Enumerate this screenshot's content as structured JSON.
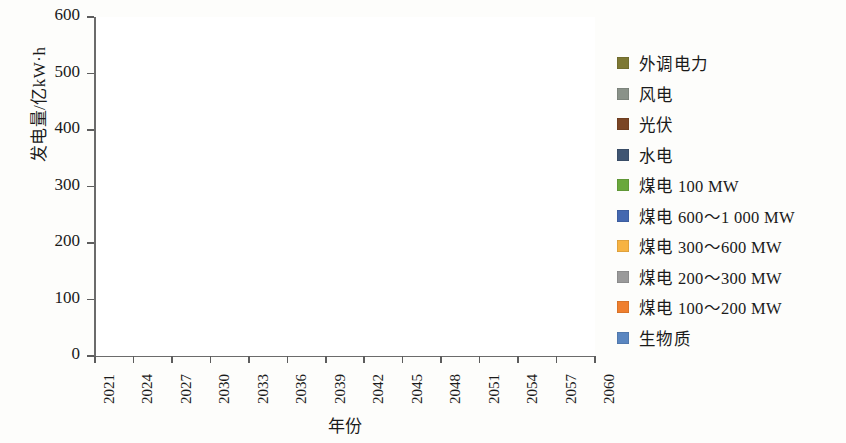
{
  "axes": {
    "y_title": "发电量/亿kW·h",
    "x_title": "年份",
    "y_ticks": [
      "0",
      "100",
      "200",
      "300",
      "400",
      "500",
      "600"
    ],
    "x_ticks": [
      "2021",
      "2024",
      "2027",
      "2030",
      "2033",
      "2036",
      "2039",
      "2042",
      "2045",
      "2048",
      "2051",
      "2054",
      "2057",
      "2060"
    ]
  },
  "legend": {
    "items": [
      {
        "label": "外调电力",
        "color": "#7d7833"
      },
      {
        "label": "风电",
        "color": "#8a9289"
      },
      {
        "label": "光伏",
        "color": "#7a4524"
      },
      {
        "label": "水电",
        "color": "#3f5572"
      },
      {
        "label": "煤电  100 MW",
        "color": "#6aa83c"
      },
      {
        "label": "煤电  600～1 000 MW",
        "color": "#4468b0"
      },
      {
        "label": "煤电  300～600 MW",
        "color": "#f7b342"
      },
      {
        "label": "煤电  200～300 MW",
        "color": "#9a9a9a"
      },
      {
        "label": "煤电  100～200 MW",
        "color": "#ef7f2e"
      },
      {
        "label": "生物质",
        "color": "#5a86c0"
      }
    ]
  },
  "chart_data": {
    "type": "area",
    "stacked": true,
    "title": "",
    "xlabel": "年份",
    "ylabel": "发电量/亿kW·h",
    "ylim": [
      0,
      600
    ],
    "grid": false,
    "legend_position": "right",
    "x": [
      2021,
      2022,
      2023,
      2024,
      2025,
      2026,
      2027,
      2028,
      2029,
      2030,
      2031,
      2032,
      2033,
      2034,
      2035,
      2036,
      2037,
      2038,
      2039,
      2040,
      2041,
      2042,
      2043,
      2044,
      2045,
      2046,
      2047,
      2048,
      2049,
      2050,
      2051,
      2052,
      2053,
      2054,
      2055,
      2056,
      2057,
      2058,
      2059,
      2060
    ],
    "series": [
      {
        "name": "生物质",
        "color": "#5a86c0",
        "values": [
          0,
          0,
          0,
          0,
          0,
          0,
          0,
          0,
          0,
          0,
          0,
          0,
          0,
          0,
          0,
          0,
          0,
          0,
          0,
          0,
          0,
          0,
          0,
          0,
          0,
          0,
          0,
          0,
          0,
          0,
          0,
          0,
          0,
          0,
          0,
          0,
          0,
          0,
          0,
          0
        ]
      },
      {
        "name": "煤电  100～200 MW",
        "color": "#ef7f2e",
        "values": [
          10,
          9,
          8,
          7,
          6,
          4,
          2,
          0,
          0,
          0,
          0,
          0,
          0,
          0,
          0,
          0,
          0,
          0,
          0,
          0,
          0,
          0,
          0,
          0,
          0,
          0,
          0,
          0,
          0,
          0,
          0,
          0,
          0,
          0,
          0,
          0,
          0,
          0,
          0,
          0
        ]
      },
      {
        "name": "煤电  200～300 MW",
        "color": "#9a9a9a",
        "values": [
          80,
          78,
          76,
          74,
          72,
          70,
          68,
          66,
          64,
          62,
          58,
          54,
          48,
          44,
          38,
          32,
          26,
          20,
          14,
          8,
          4,
          0,
          0,
          0,
          0,
          0,
          0,
          0,
          0,
          0,
          0,
          0,
          0,
          0,
          0,
          0,
          0,
          0,
          0,
          0
        ]
      },
      {
        "name": "煤电  300～600 MW",
        "color": "#f7b342",
        "values": [
          82,
          86,
          88,
          86,
          84,
          82,
          80,
          82,
          84,
          86,
          84,
          82,
          80,
          78,
          76,
          74,
          74,
          72,
          70,
          66,
          62,
          56,
          46,
          28,
          0,
          0,
          0,
          0,
          0,
          0,
          0,
          0,
          0,
          0,
          0,
          0,
          0,
          0,
          0,
          0
        ]
      },
      {
        "name": "煤电  600～1 000 MW",
        "color": "#4468b0",
        "values": [
          0,
          0,
          0,
          0,
          2,
          10,
          20,
          28,
          40,
          46,
          52,
          58,
          62,
          66,
          70,
          74,
          78,
          82,
          86,
          88,
          90,
          90,
          88,
          86,
          80,
          74,
          72,
          72,
          72,
          72,
          72,
          72,
          72,
          72,
          72,
          72,
          72,
          72,
          72,
          72
        ]
      },
      {
        "name": "煤电  100 MW",
        "color": "#6aa83c",
        "values": [
          0,
          0,
          0,
          0,
          0,
          0,
          0,
          0,
          0,
          0,
          0,
          0,
          0,
          0,
          0,
          0,
          0,
          0,
          0,
          0,
          0,
          0,
          0,
          0,
          0,
          0,
          0,
          0,
          0,
          0,
          0,
          0,
          0,
          0,
          0,
          0,
          0,
          0,
          0,
          0
        ]
      },
      {
        "name": "水电",
        "color": "#3f5572",
        "values": [
          14,
          14,
          14,
          14,
          14,
          14,
          14,
          14,
          14,
          14,
          14,
          14,
          14,
          14,
          14,
          14,
          14,
          14,
          14,
          14,
          14,
          14,
          12,
          10,
          0,
          0,
          0,
          0,
          0,
          0,
          0,
          0,
          0,
          0,
          0,
          0,
          0,
          0,
          0,
          0
        ]
      },
      {
        "name": "光伏",
        "color": "#7a4524",
        "values": [
          16,
          20,
          24,
          28,
          32,
          36,
          40,
          44,
          48,
          52,
          58,
          64,
          70,
          76,
          82,
          88,
          96,
          104,
          112,
          120,
          130,
          140,
          152,
          166,
          184,
          196,
          206,
          216,
          226,
          236,
          244,
          252,
          262,
          272,
          280,
          288,
          292,
          296,
          298,
          300
        ]
      },
      {
        "name": "风电",
        "color": "#8a9289",
        "values": [
          4,
          5,
          6,
          7,
          8,
          9,
          10,
          11,
          12,
          14,
          16,
          18,
          20,
          22,
          24,
          26,
          28,
          30,
          32,
          34,
          36,
          40,
          44,
          48,
          52,
          54,
          56,
          58,
          58,
          58,
          58,
          58,
          58,
          58,
          58,
          58,
          58,
          58,
          58,
          56
        ]
      },
      {
        "name": "外调电力",
        "color": "#7d7833",
        "values": [
          6,
          14,
          24,
          34,
          46,
          58,
          68,
          78,
          86,
          96,
          106,
          114,
          124,
          134,
          142,
          150,
          156,
          162,
          168,
          172,
          176,
          178,
          180,
          176,
          172,
          166,
          160,
          152,
          144,
          134,
          122,
          108,
          96,
          84,
          72,
          60,
          48,
          36,
          24,
          12
        ]
      }
    ]
  }
}
